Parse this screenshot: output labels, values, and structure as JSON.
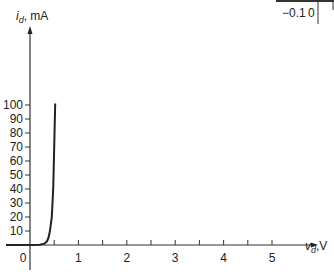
{
  "chart_data": {
    "type": "line",
    "title": "",
    "xlabel": "v_d, V",
    "ylabel": "i_d, mA",
    "xlabel_main": "v",
    "xlabel_sub": "d",
    "xlabel_unit": ",V",
    "ylabel_main": "i",
    "ylabel_sub": "d",
    "ylabel_unit": ", mA",
    "xlim": [
      -0.6,
      5.8
    ],
    "ylim": [
      -16,
      120
    ],
    "x_ticks": [
      0.5,
      1,
      1.5,
      2,
      2.5,
      3,
      3.5,
      4,
      4.5,
      5
    ],
    "x_tick_labels": [
      {
        "value": 0,
        "label": "0"
      },
      {
        "value": 1,
        "label": "1"
      },
      {
        "value": 2,
        "label": "2"
      },
      {
        "value": 3,
        "label": "3"
      },
      {
        "value": 4,
        "label": "4"
      },
      {
        "value": 5,
        "label": "5"
      }
    ],
    "y_ticks": [
      10,
      20,
      30,
      40,
      50,
      60,
      70,
      80,
      90,
      100
    ],
    "y_tick_labels": [
      "10",
      "20",
      "30",
      "40",
      "50",
      "60",
      "70",
      "80",
      "90",
      "100"
    ],
    "grid": false,
    "series": [
      {
        "name": "diode characteristic",
        "x": [
          -0.6,
          0,
          0.2,
          0.3,
          0.35,
          0.38,
          0.4,
          0.42,
          0.45,
          0.48,
          0.5,
          0.52
        ],
        "y": [
          0,
          0,
          0.2,
          1,
          2.5,
          5,
          8,
          12,
          20,
          40,
          70,
          101
        ]
      }
    ],
    "inset": {
      "tick_labels": [
        "−0.1",
        "0"
      ]
    }
  }
}
